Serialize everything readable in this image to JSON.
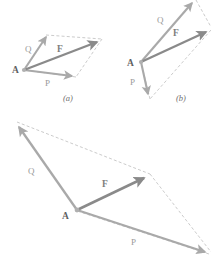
{
  "figure": {
    "background_color": "#ffffff",
    "colors": {
      "component_vector": "#a9a9a9",
      "resultant_vector": "#8a8a8a",
      "dashed_line": "#b5b5b5",
      "label_text": "#9a9a9a",
      "point_text": "#5f5f5f",
      "part_text": "#6f6f6f"
    },
    "panels": [
      {
        "id": "a",
        "caption": "(a)",
        "caption_pos": {
          "x": 67,
          "y": 100
        },
        "origin": {
          "label": "A",
          "x": 24,
          "y": 70,
          "label_x": 12,
          "label_y": 73
        },
        "vectors": [
          {
            "name": "Q",
            "label": "Q",
            "from": {
              "x": 24,
              "y": 70
            },
            "to": {
              "x": 46,
              "y": 35
            },
            "label_pos": {
              "x": 25,
              "y": 52
            },
            "kind": "component"
          },
          {
            "name": "P",
            "label": "P",
            "from": {
              "x": 24,
              "y": 70
            },
            "to": {
              "x": 74,
              "y": 76
            },
            "label_pos": {
              "x": 45,
              "y": 86
            },
            "kind": "component"
          },
          {
            "name": "F",
            "label": "F",
            "from": {
              "x": 24,
              "y": 70
            },
            "to": {
              "x": 100,
              "y": 41
            },
            "label_pos": {
              "x": 57,
              "y": 52
            },
            "kind": "resultant"
          }
        ],
        "dashed": [
          {
            "from": {
              "x": 46,
              "y": 35
            },
            "to": {
              "x": 102,
              "y": 39
            }
          },
          {
            "from": {
              "x": 102,
              "y": 39
            },
            "to": {
              "x": 76,
              "y": 77
            }
          },
          {
            "from": {
              "x": 76,
              "y": 77
            },
            "to": {
              "x": 24,
              "y": 70
            }
          }
        ]
      },
      {
        "id": "b",
        "caption": "(b)",
        "caption_pos": {
          "x": 180,
          "y": 100
        },
        "origin": {
          "label": "A",
          "x": 141,
          "y": 62,
          "label_x": 128,
          "label_y": 65
        },
        "vectors": [
          {
            "name": "Q",
            "label": "Q",
            "from": {
              "x": 141,
              "y": 62
            },
            "to": {
              "x": 194,
              "y": 1
            },
            "label_pos": {
              "x": 158,
              "y": 21
            },
            "kind": "component"
          },
          {
            "name": "P",
            "label": "P",
            "from": {
              "x": 141,
              "y": 62
            },
            "to": {
              "x": 149,
              "y": 98
            },
            "label_pos": {
              "x": 132,
              "y": 84
            },
            "kind": "component"
          },
          {
            "name": "F",
            "label": "F",
            "from": {
              "x": 141,
              "y": 62
            },
            "to": {
              "x": 209,
              "y": 31
            },
            "label_pos": {
              "x": 174,
              "y": 34
            },
            "kind": "resultant"
          }
        ],
        "dashed": [
          {
            "from": {
              "x": 196,
              "y": 0
            },
            "to": {
              "x": 211,
              "y": 27
            }
          },
          {
            "from": {
              "x": 211,
              "y": 30
            },
            "to": {
              "x": 150,
              "y": 99
            }
          },
          {
            "from": {
              "x": 150,
              "y": 99
            },
            "to": {
              "x": 141,
              "y": 62
            }
          }
        ]
      },
      {
        "id": "c",
        "caption": "",
        "caption_pos": {
          "x": 0,
          "y": 0
        },
        "origin": {
          "label": "A",
          "x": 77,
          "y": 210,
          "label_x": 64,
          "label_y": 218
        },
        "vectors": [
          {
            "name": "Q",
            "label": "Q",
            "from": {
              "x": 77,
              "y": 210
            },
            "to": {
              "x": 16,
              "y": 124
            },
            "label_pos": {
              "x": 30,
              "y": 172
            },
            "kind": "component"
          },
          {
            "name": "P",
            "label": "P",
            "from": {
              "x": 77,
              "y": 210
            },
            "to": {
              "x": 209,
              "y": 253
            },
            "label_pos": {
              "x": 133,
              "y": 243
            },
            "kind": "component"
          },
          {
            "name": "F",
            "label": "F",
            "from": {
              "x": 77,
              "y": 210
            },
            "to": {
              "x": 148,
              "y": 176
            },
            "label_pos": {
              "x": 104,
              "y": 184
            },
            "kind": "resultant"
          }
        ],
        "dashed": [
          {
            "from": {
              "x": 17,
              "y": 122
            },
            "to": {
              "x": 150,
              "y": 174
            }
          },
          {
            "from": {
              "x": 150,
              "y": 174
            },
            "to": {
              "x": 211,
              "y": 252
            }
          },
          {
            "from": {
              "x": 209,
              "y": 254
            },
            "to": {
              "x": 77,
              "y": 211
            }
          }
        ]
      }
    ]
  }
}
